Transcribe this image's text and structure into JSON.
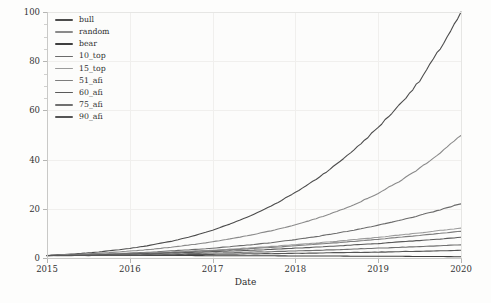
{
  "chart_data": {
    "type": "line",
    "title": "",
    "xlabel": "Date",
    "ylabel": "",
    "xlim": [
      2015,
      2020
    ],
    "ylim": [
      0,
      100
    ],
    "x_ticks": [
      "2015",
      "2016",
      "2017",
      "2018",
      "2019",
      "2020"
    ],
    "y_ticks": [
      "0",
      "20",
      "40",
      "60",
      "80",
      "100"
    ],
    "grid": true,
    "legend_position": "upper-left",
    "x": [
      2015.0,
      2015.25,
      2015.5,
      2015.75,
      2016.0,
      2016.25,
      2016.5,
      2016.75,
      2017.0,
      2017.25,
      2017.5,
      2017.75,
      2018.0,
      2018.25,
      2018.5,
      2018.75,
      2019.0,
      2019.25,
      2019.5,
      2019.75,
      2020.0
    ],
    "series": [
      {
        "name": "bull",
        "color": "#4c4c4c",
        "values": [
          1.0,
          1.5,
          2.1,
          2.9,
          3.9,
          5.2,
          6.8,
          8.8,
          11.3,
          14.3,
          17.8,
          21.9,
          26.6,
          32.0,
          38.2,
          45.2,
          53.1,
          62.0,
          71.9,
          85.2,
          99.5
        ]
      },
      {
        "name": "random",
        "color": "#8a8a8a",
        "values": [
          1.0,
          1.3,
          1.7,
          2.2,
          2.8,
          3.5,
          4.4,
          5.4,
          6.6,
          8.0,
          9.6,
          11.4,
          13.5,
          16.0,
          18.9,
          22.3,
          26.3,
          31.0,
          36.5,
          42.8,
          49.8
        ]
      },
      {
        "name": "bear",
        "color": "#3f3f3f",
        "values": [
          1.0,
          1.0,
          1.0,
          1.0,
          1.0,
          1.0,
          1.0,
          1.0,
          0.9,
          0.9,
          0.9,
          0.9,
          0.8,
          0.8,
          0.8,
          0.7,
          0.7,
          0.7,
          0.6,
          0.6,
          0.5
        ]
      },
      {
        "name": "10_top",
        "color": "#6b6b6b",
        "values": [
          1.0,
          1.2,
          1.4,
          1.7,
          2.0,
          2.4,
          2.9,
          3.4,
          4.0,
          4.7,
          5.5,
          6.4,
          7.5,
          8.7,
          10.1,
          11.6,
          13.3,
          15.2,
          17.3,
          19.6,
          22.1
        ]
      },
      {
        "name": "15_top",
        "color": "#9b9b9b",
        "values": [
          1.0,
          1.1,
          1.3,
          1.5,
          1.8,
          2.1,
          2.4,
          2.8,
          3.2,
          3.7,
          4.2,
          4.8,
          5.4,
          6.1,
          6.8,
          7.6,
          8.4,
          9.3,
          10.2,
          11.2,
          12.2
        ]
      },
      {
        "name": "51_afi",
        "color": "#7d7d7d",
        "values": [
          1.0,
          1.1,
          1.3,
          1.5,
          1.7,
          2.0,
          2.3,
          2.6,
          3.0,
          3.4,
          3.9,
          4.4,
          5.0,
          5.6,
          6.2,
          6.9,
          7.6,
          8.4,
          9.2,
          10.0,
          10.9
        ]
      },
      {
        "name": "60_afi",
        "color": "#5a5a5a",
        "values": [
          1.0,
          1.1,
          1.2,
          1.4,
          1.6,
          1.8,
          2.0,
          2.3,
          2.6,
          2.9,
          3.2,
          3.6,
          4.0,
          4.4,
          4.9,
          5.4,
          5.9,
          6.5,
          7.1,
          7.7,
          8.4
        ]
      },
      {
        "name": "75_afi",
        "color": "#707070",
        "values": [
          1.0,
          1.0,
          1.1,
          1.2,
          1.3,
          1.5,
          1.6,
          1.8,
          2.0,
          2.2,
          2.4,
          2.6,
          2.9,
          3.1,
          3.4,
          3.7,
          4.0,
          4.3,
          4.6,
          5.0,
          5.4
        ]
      },
      {
        "name": "90_afi",
        "color": "#555555",
        "values": [
          1.0,
          1.0,
          1.0,
          1.1,
          1.1,
          1.2,
          1.3,
          1.4,
          1.5,
          1.6,
          1.7,
          1.8,
          1.9,
          2.0,
          2.2,
          2.3,
          2.4,
          2.6,
          2.7,
          2.9,
          3.1
        ]
      }
    ]
  },
  "legend": {
    "items": [
      {
        "label": "bull"
      },
      {
        "label": "random"
      },
      {
        "label": "bear"
      },
      {
        "label": "10_top"
      },
      {
        "label": "15_top"
      },
      {
        "label": "51_afi"
      },
      {
        "label": "60_afi"
      },
      {
        "label": "75_afi"
      },
      {
        "label": "90_afi"
      }
    ]
  },
  "axes": {
    "x_title": "Date"
  }
}
